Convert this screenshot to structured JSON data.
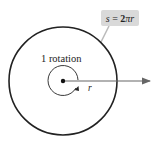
{
  "diagram": {
    "rotation_label": "1 rotation",
    "radius_label": "r",
    "formula": {
      "lhs": "s",
      "eq": " = ",
      "coef": "2",
      "pi": "π",
      "var": "r"
    },
    "colors": {
      "circle": "#222222",
      "arrow": "#666666",
      "formula_bg": "#d9d9d9",
      "leader": "#bbbbbb"
    }
  }
}
